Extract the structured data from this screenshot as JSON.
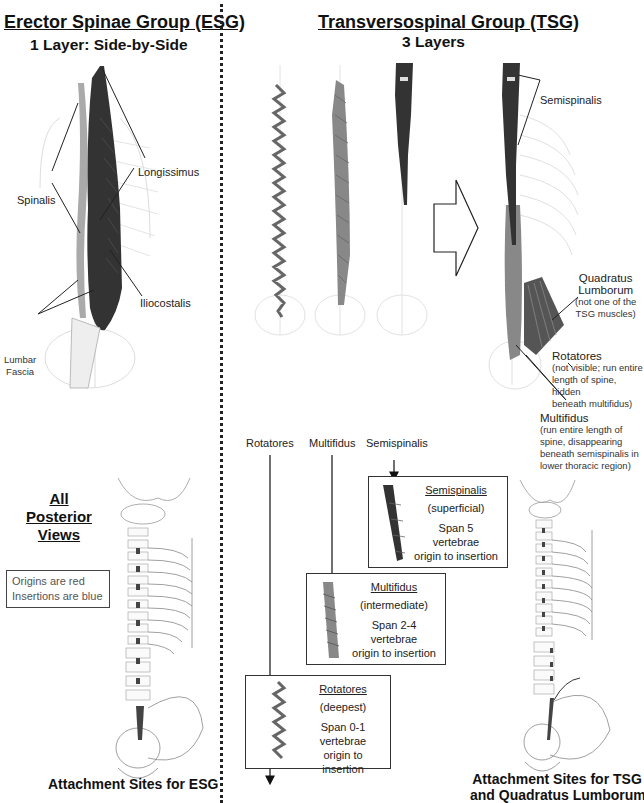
{
  "left_panel": {
    "title": "Erector Spinae Group  (ESG)",
    "subtitle": "1 Layer: Side-by-Side",
    "labels": {
      "longissimus": "Longissimus",
      "spinalis": "Spinalis",
      "iliocostalis": "Iliocostalis",
      "lumbar_fascia_line1": "Lumbar",
      "lumbar_fascia_line2": "Fascia"
    },
    "views_heading": [
      "All",
      "Posterior",
      "Views"
    ],
    "legend": {
      "line1": "Origins are red",
      "line2": "Insertions are blue"
    },
    "caption": "Attachment Sites for ESG"
  },
  "right_panel": {
    "title": "Transversospinal Group  (TSG)",
    "subtitle": "3 Layers",
    "column_labels": [
      "Rotatores",
      "Multifidus",
      "Semispinalis"
    ],
    "annotations": {
      "semispinalis": "Semispinalis",
      "quadratus_title_line1": "Quadratus",
      "quadratus_title_line2": "Lumborum",
      "quadratus_note_line1": "(not one of the",
      "quadratus_note_line2": "TSG muscles)",
      "rotatores_title": "Rotatores",
      "rotatores_note_line1": "(not visible; run entire",
      "rotatores_note_line2": "length of spine, hidden",
      "rotatores_note_line3": "beneath multifidus)",
      "multifidus_title": "Multifidus",
      "multifidus_note_line1": "(run entire length of",
      "multifidus_note_line2": "spine, disappearing",
      "multifidus_note_line3": "beneath semispinalis in",
      "multifidus_note_line4": "lower thoracic region)"
    },
    "detail_boxes": [
      {
        "name": "Semispinalis",
        "depth": "(superficial)",
        "span": "Span 5",
        "unit": "vertebrae",
        "note": "origin to insertion"
      },
      {
        "name": "Multifidus",
        "depth": "(intermediate)",
        "span": "Span 2-4",
        "unit": "vertebrae",
        "note": "origin to insertion"
      },
      {
        "name": "Rotatores",
        "depth": "(deepest)",
        "span": "Span 0-1",
        "unit": "vertebrae",
        "note": "origin to insertion"
      }
    ],
    "caption_line1": "Attachment Sites for TSG",
    "caption_line2": "and Quadratus Lumborum"
  },
  "colors": {
    "text": "#111111",
    "muscle_dark": "#2a2a2a",
    "muscle_mid": "#6a6a6a",
    "bone_faint": "#d8d8d8"
  }
}
